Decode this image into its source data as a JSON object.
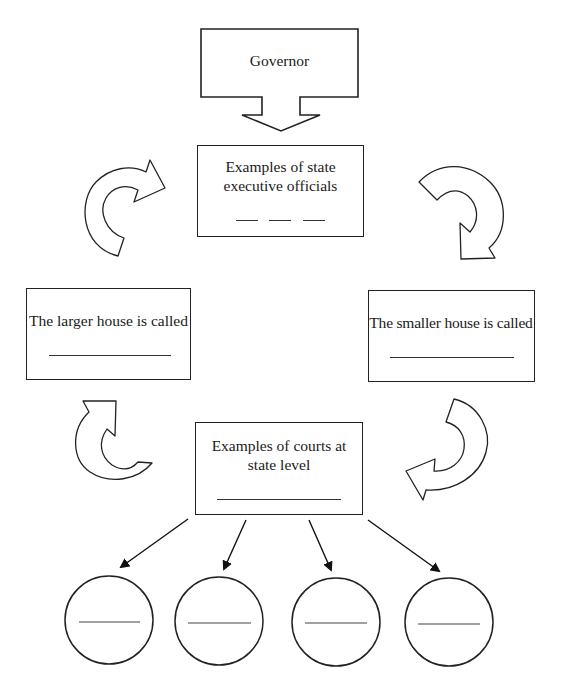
{
  "diagram": {
    "nodes": {
      "governor": {
        "label": "Governor"
      },
      "executive_officials": {
        "label_line1": "Examples of state",
        "label_line2": "executive officials",
        "blanks": 3
      },
      "larger_house": {
        "label": "The larger house is called",
        "blanks": 1
      },
      "smaller_house": {
        "label": "The smaller house is called",
        "blanks": 1
      },
      "state_courts": {
        "label_line1": "Examples of courts at",
        "label_line2": "state level",
        "blanks": 1
      },
      "court_circles": [
        {
          "blank": ""
        },
        {
          "blank": ""
        },
        {
          "blank": ""
        },
        {
          "blank": ""
        }
      ]
    },
    "connectors": [
      {
        "from": "governor",
        "to": "executive_officials",
        "type": "block-arrow-down"
      },
      {
        "from": "executive_officials",
        "to": "smaller_house",
        "type": "curved-arrow-clockwise"
      },
      {
        "from": "smaller_house",
        "to": "state_courts",
        "type": "curved-arrow-clockwise"
      },
      {
        "from": "state_courts",
        "to": "larger_house",
        "type": "curved-arrow-clockwise"
      },
      {
        "from": "larger_house",
        "to": "executive_officials",
        "type": "curved-arrow-clockwise"
      },
      {
        "from": "state_courts",
        "to": "court_circle_1",
        "type": "line-arrow"
      },
      {
        "from": "state_courts",
        "to": "court_circle_2",
        "type": "line-arrow"
      },
      {
        "from": "state_courts",
        "to": "court_circle_3",
        "type": "line-arrow"
      },
      {
        "from": "state_courts",
        "to": "court_circle_4",
        "type": "line-arrow"
      }
    ],
    "colors": {
      "stroke": "#222222",
      "fill": "#ffffff",
      "text": "#1a1a1a"
    }
  }
}
